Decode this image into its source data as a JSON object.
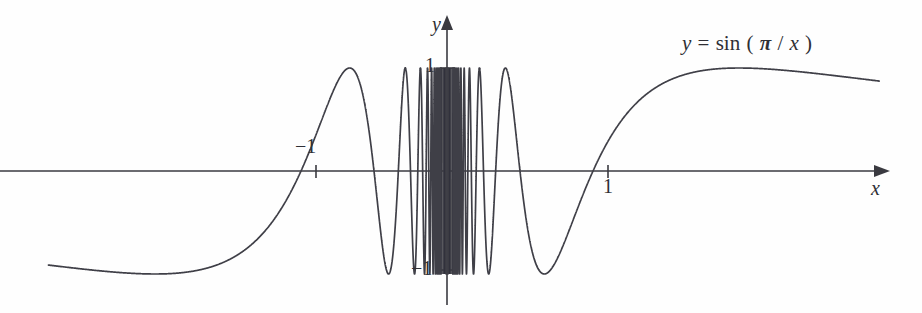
{
  "figure": {
    "kind": "function-graph",
    "background_color": "#fefefe",
    "curve_color": "#3f3f47",
    "axis_color": "#3a3a40"
  },
  "labels": {
    "curve_equation": "y = sin(π/x)",
    "curve_equation_parts": {
      "lhs": "y",
      "equals": "=",
      "fn": "sin",
      "open": "(",
      "pi": "π",
      "slash": "/",
      "var": "x",
      "close": ")"
    },
    "axis_y_name": "y",
    "axis_x_name": "x",
    "tick_y_positive": "1",
    "tick_y_negative": "−1",
    "tick_x_negative": "−1",
    "tick_x_positive": "1"
  },
  "chart_data": {
    "type": "line",
    "title": "",
    "subtitle": "",
    "xlabel": "x",
    "ylabel": "y",
    "expression": "y = sin(pi/x)",
    "legend": [
      "y = sin(π/x)"
    ],
    "legend_position": "top-right-annotation",
    "grid": false,
    "xlim": [
      -2.73,
      2.96
    ],
    "ylim": [
      -1.48,
      1.48
    ],
    "xticks": [
      -1,
      1
    ],
    "xticklabels": [
      "−1",
      "1"
    ],
    "yticks": [
      -1,
      1
    ],
    "yticklabels": [
      "−1",
      "1"
    ],
    "axis_arrows": {
      "x_right": true,
      "y_up": true
    },
    "zero_crossings_shown": [
      -1,
      1,
      -0.5,
      0.5,
      -0.3333,
      0.3333,
      -0.25,
      0.25,
      -0.2,
      0.2
    ],
    "annotations": [
      {
        "text": "y = sin(π/x)",
        "x": 1.62,
        "y": 1.27
      }
    ],
    "series": [
      {
        "name": "y = sin(π/x)",
        "color": "#3f3f47",
        "x": [
          -2.73,
          -2.6,
          -2.5,
          -2.4,
          -2.3,
          -2.2,
          -2.1,
          -2.0,
          -1.9,
          -1.8,
          -1.7,
          -1.6,
          -1.5,
          -1.4,
          -1.3,
          -1.2,
          -1.1,
          -1.0,
          -0.95,
          -0.9,
          -0.85,
          -0.8,
          -0.75,
          -0.7,
          -0.666,
          -0.6,
          -0.571,
          -0.5,
          -0.444,
          -0.4,
          -0.363,
          -0.3333,
          -0.307,
          -0.2857,
          -0.2666,
          -0.25,
          -0.235,
          -0.222,
          -0.2105,
          -0.2,
          0.2,
          0.2105,
          0.222,
          0.235,
          0.25,
          0.2666,
          0.2857,
          0.307,
          0.3333,
          0.363,
          0.4,
          0.444,
          0.5,
          0.571,
          0.6,
          0.666,
          0.7,
          0.75,
          0.8,
          0.85,
          0.9,
          0.95,
          1.0,
          1.1,
          1.2,
          1.3,
          1.4,
          1.5,
          1.6,
          1.7,
          1.8,
          1.9,
          2.0,
          2.1,
          2.2,
          2.3,
          2.4,
          2.5,
          2.6,
          2.73,
          2.96
        ],
        "y": [
          -0.373,
          -0.385,
          -0.395,
          -0.406,
          -0.418,
          -0.432,
          -0.447,
          -0.464,
          -0.482,
          -0.503,
          -0.527,
          -0.555,
          -0.587,
          -0.624,
          -0.669,
          -0.724,
          -0.79,
          -0.866,
          -0.905,
          -0.943,
          -0.977,
          -0.999,
          -0.996,
          -0.949,
          -0.866,
          -0.577,
          0.0,
          0.866,
          0.0,
          -0.866,
          0.0,
          0.866,
          0.0,
          -0.866,
          0.0,
          0.866,
          0.0,
          -0.866,
          0.0,
          0.866,
          -0.866,
          0.0,
          0.866,
          0.0,
          -0.866,
          0.0,
          0.866,
          0.0,
          -0.866,
          0.0,
          0.866,
          0.0,
          -0.866,
          0.0,
          0.577,
          0.866,
          0.949,
          0.996,
          0.999,
          0.977,
          0.943,
          0.905,
          0.866,
          0.79,
          0.724,
          0.669,
          0.624,
          0.587,
          0.555,
          0.527,
          0.503,
          0.482,
          0.464,
          0.447,
          0.432,
          0.418,
          0.406,
          0.395,
          0.385,
          0.373,
          0.345
        ],
        "note": "Oscillation frequency increases without bound as x approaches 0; near-origin band is rendered as dense vertical strokes."
      }
    ]
  }
}
